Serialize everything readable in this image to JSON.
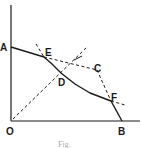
{
  "figure": {
    "labels": {
      "A": "A",
      "B": "B",
      "C": "C",
      "D": "D",
      "E": "E",
      "F": "F",
      "O": "O"
    },
    "caption": "Fig."
  },
  "colors": {
    "ink": "#1a1a1a",
    "background": "#ffffff"
  }
}
